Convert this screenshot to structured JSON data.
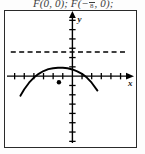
{
  "answer": {
    "text_before": "F(0, 0); F(",
    "fraction_numerator": "1",
    "fraction_denominator": "8",
    "text_minus": "−",
    "text_after": ", 0);"
  },
  "figure": {
    "name": "parabola-with-directrix-graph",
    "axis_x_label": "x",
    "axis_y_label": "y",
    "frame_color": "#2a2a2a",
    "curve_color": "#000000",
    "directrix_color": "#000000",
    "point_color": "#000000"
  },
  "chart_data": {
    "type": "line",
    "title": "",
    "xlabel": "x",
    "ylabel": "y",
    "grid": false,
    "legend": null,
    "axis_style": "cartesian-cross-with-tick-marks",
    "xlim": [
      -7.0,
      6.5
    ],
    "ylim": [
      -7.5,
      7.0
    ],
    "x_tick_step": 1,
    "y_tick_step": 1,
    "x_ticks": [
      -7,
      -6,
      -5,
      -4,
      -3,
      -2,
      -1,
      1,
      2,
      3,
      4,
      5,
      6
    ],
    "y_ticks": [
      -7,
      -6,
      -5,
      -4,
      -3,
      -2,
      -1,
      1,
      2,
      3,
      4,
      5,
      6
    ],
    "tick_labels_shown": false,
    "series": [
      {
        "name": "parabola",
        "style": "solid",
        "kind": "downward-parabola",
        "vertex": [
          -1.0,
          0.9
        ],
        "x_range": [
          -5.4,
          2.6
        ],
        "points": [
          [
            -5.4,
            -2.1
          ],
          [
            -5.0,
            -1.4
          ],
          [
            -4.5,
            -0.7
          ],
          [
            -4.0,
            -0.15
          ],
          [
            -3.5,
            0.25
          ],
          [
            -3.0,
            0.55
          ],
          [
            -2.5,
            0.75
          ],
          [
            -2.0,
            0.85
          ],
          [
            -1.5,
            0.9
          ],
          [
            -1.0,
            0.9
          ],
          [
            -0.5,
            0.85
          ],
          [
            0.0,
            0.72
          ],
          [
            0.5,
            0.52
          ],
          [
            1.0,
            0.25
          ],
          [
            1.5,
            -0.15
          ],
          [
            2.0,
            -0.7
          ],
          [
            2.6,
            -1.55
          ]
        ]
      },
      {
        "name": "directrix",
        "style": "dashed",
        "kind": "horizontal-line",
        "y": 2.6,
        "x_range": [
          -6.4,
          5.7
        ]
      }
    ],
    "markers": [
      {
        "name": "focus-point",
        "shape": "filled-circle",
        "x": -1.4,
        "y": -0.65
      }
    ]
  }
}
